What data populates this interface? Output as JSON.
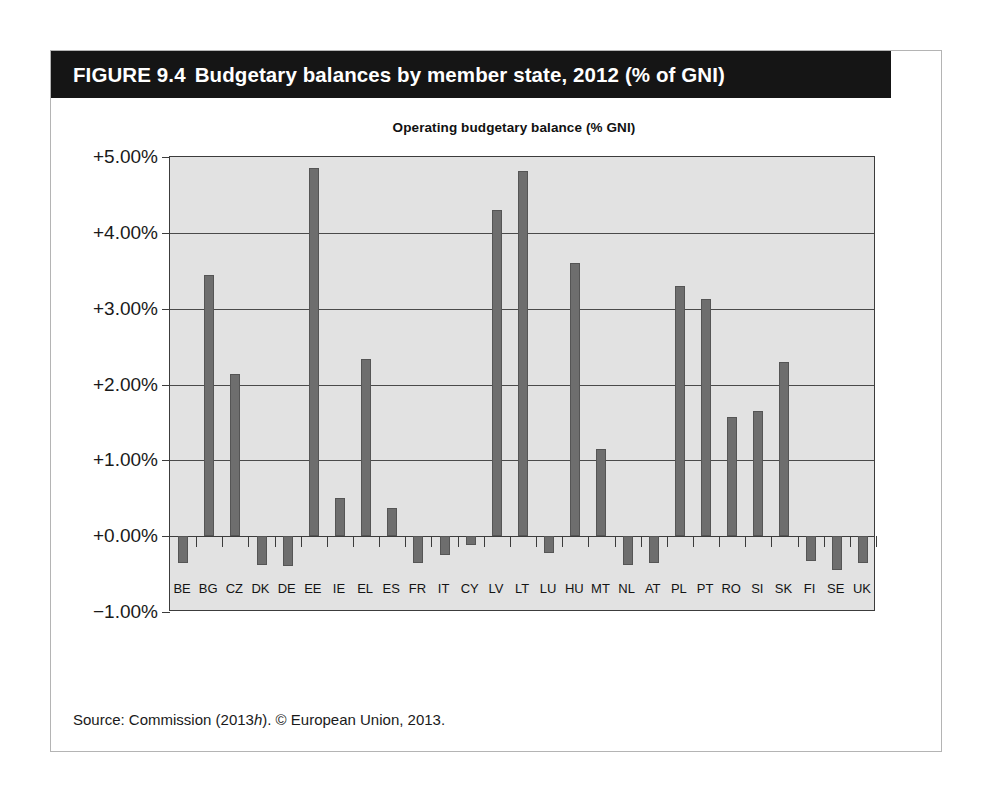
{
  "figure": {
    "number": "FIGURE 9.4",
    "title": "Budgetary balances by member state, 2012 (% of GNI)",
    "source_prefix": "Source: Commission (2013",
    "source_italic": "h",
    "source_suffix": "). © European Union, 2013."
  },
  "colors": {
    "banner_background": "#151515",
    "banner_text": "#ffffff",
    "plot_background": "#e2e2e2",
    "bar_fill": "#6e6e6e",
    "bar_stroke": "#555555",
    "gridline": "#4a4a4a",
    "axis": "#3c3c3c",
    "figure_border": "#b4b4b4",
    "page_background": "#ffffff"
  },
  "chart_data": {
    "type": "bar",
    "title": "Operating budgetary balance (% GNI)",
    "xlabel": "",
    "ylabel": "",
    "ylim": [
      -1.0,
      5.0
    ],
    "ytick_labels": [
      "+5.00%",
      "+4.00%",
      "+3.00%",
      "+2.00%",
      "+1.00%",
      "+0.00%",
      "−1.00%"
    ],
    "ytick_values": [
      5.0,
      4.0,
      3.0,
      2.0,
      1.0,
      0.0,
      -1.0
    ],
    "grid": true,
    "legend": "none",
    "categories": [
      "BE",
      "BG",
      "CZ",
      "DK",
      "DE",
      "EE",
      "IE",
      "EL",
      "ES",
      "FR",
      "IT",
      "CY",
      "LV",
      "LT",
      "LU",
      "HU",
      "MT",
      "NL",
      "AT",
      "PL",
      "PT",
      "RO",
      "SI",
      "SK",
      "FI",
      "SE",
      "UK"
    ],
    "values": [
      -0.35,
      3.44,
      2.14,
      -0.38,
      -0.39,
      4.86,
      0.5,
      2.33,
      0.37,
      -0.35,
      -0.25,
      -0.12,
      4.3,
      4.82,
      -0.22,
      3.6,
      1.15,
      -0.38,
      -0.35,
      3.3,
      3.13,
      1.57,
      1.65,
      2.3,
      -0.33,
      -0.44,
      -0.36
    ]
  }
}
